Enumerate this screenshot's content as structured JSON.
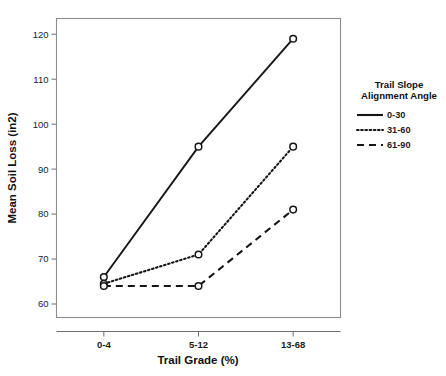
{
  "chart_data": {
    "type": "line",
    "title": "",
    "xlabel": "Trail Grade (%)",
    "ylabel": "Mean Soil Loss (in2)",
    "categories": [
      "0-4",
      "5-12",
      "13-68"
    ],
    "ylim": [
      57,
      123.5
    ],
    "yticks": [
      60,
      70,
      80,
      90,
      100,
      110,
      120
    ],
    "ytick_labels": [
      "60",
      "70",
      "80",
      "90",
      "100",
      "110",
      "120"
    ],
    "grid": false,
    "legend_position": "right",
    "legend_title": "Trail Slope\nAlignment Angle",
    "legend_title_line1": "Trail Slope",
    "legend_title_line2": "Alignment Angle",
    "series": [
      {
        "name": "0-30",
        "style": "solid",
        "values": [
          66,
          95,
          119
        ]
      },
      {
        "name": "31-60",
        "style": "dotted",
        "values": [
          64.5,
          71,
          95
        ]
      },
      {
        "name": "61-90",
        "style": "dashed",
        "values": [
          64,
          64,
          81
        ]
      }
    ]
  }
}
